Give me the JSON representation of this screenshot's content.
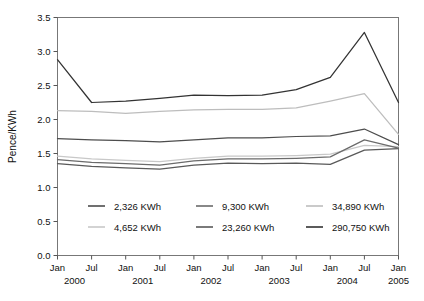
{
  "chart_data": {
    "type": "line",
    "title": "",
    "xlabel": "",
    "ylabel": "Pence/KWh",
    "ylim": [
      0.0,
      3.5
    ],
    "ytick_step": 0.5,
    "yticks": [
      "0.0",
      "0.5",
      "1.0",
      "1.5",
      "2.0",
      "2.5",
      "3.0",
      "3.5"
    ],
    "grid": false,
    "legend_position": "inside-bottom-left",
    "x": [
      "Jan 2000",
      "Jul 2000",
      "Jan 2001",
      "Jul 2001",
      "Jan 2002",
      "Jul 2002",
      "Jan 2003",
      "Jul 2003",
      "Jan 2004",
      "Jul 2004",
      "Jan 2005"
    ],
    "xtick_labels": [
      "Jan",
      "Jul",
      "Jan",
      "Jul",
      "Jan",
      "Jul",
      "Jan",
      "Jul",
      "Jan",
      "Jul",
      "Jan"
    ],
    "xtick_years": [
      "2000",
      "",
      "2001",
      "",
      "2002",
      "",
      "2003",
      "",
      "2004",
      "",
      "2005"
    ],
    "year_group_labels": [
      "2000",
      "2001",
      "2002",
      "2003",
      "2004",
      "2005"
    ],
    "series": [
      {
        "name": "2,326 KWh",
        "color": "#4d4d4d",
        "values": [
          1.72,
          1.7,
          1.69,
          1.67,
          1.7,
          1.73,
          1.73,
          1.75,
          1.76,
          1.86,
          1.63
        ]
      },
      {
        "name": "4,652 KWh",
        "color": "#c8c8c8",
        "values": [
          1.46,
          1.42,
          1.4,
          1.38,
          1.43,
          1.46,
          1.46,
          1.47,
          1.49,
          1.62,
          1.6
        ]
      },
      {
        "name": "9,300 KWh",
        "color": "#6b6b6b",
        "values": [
          1.41,
          1.37,
          1.35,
          1.33,
          1.39,
          1.42,
          1.42,
          1.43,
          1.45,
          1.7,
          1.58
        ]
      },
      {
        "name": "23,260 KWh",
        "color": "#595959",
        "values": [
          1.35,
          1.31,
          1.29,
          1.27,
          1.33,
          1.36,
          1.35,
          1.36,
          1.34,
          1.55,
          1.57
        ]
      },
      {
        "name": "34,890 KWh",
        "color": "#bdbdbd",
        "values": [
          2.13,
          2.12,
          2.09,
          2.12,
          2.14,
          2.15,
          2.15,
          2.17,
          2.27,
          2.38,
          1.78
        ]
      },
      {
        "name": "290,750 KWh",
        "color": "#333333",
        "values": [
          2.88,
          2.25,
          2.27,
          2.31,
          2.36,
          2.35,
          2.36,
          2.44,
          2.62,
          3.28,
          2.25
        ]
      }
    ],
    "legend_order": [
      "2,326 KWh",
      "9,300 KWh",
      "34,890 KWh",
      "4,652 KWh",
      "23,260 KWh",
      "290,750 KWh"
    ]
  }
}
